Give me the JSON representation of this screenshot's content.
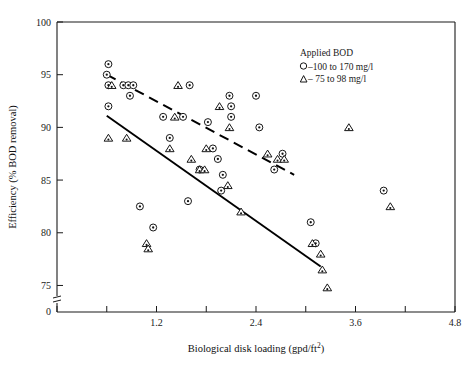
{
  "chart_data": {
    "type": "scatter",
    "title": "",
    "xlabel": "Biological disk loading (gpd/ft²)",
    "ylabel": "Efficiency (% BOD removal)",
    "xlim": [
      0,
      4.8
    ],
    "ylim": [
      74,
      100
    ],
    "xticks": [
      0,
      0.6,
      1.2,
      1.8,
      2.4,
      3.0,
      3.6,
      4.2,
      4.8
    ],
    "xticklabels": [
      "",
      "",
      "1.2",
      "",
      "2.4",
      "",
      "3.6",
      "",
      "4.8"
    ],
    "yticks": [
      75,
      80,
      85,
      90,
      95,
      100
    ],
    "yticklabels": [
      "75",
      "80",
      "85",
      "90",
      "95",
      "100"
    ],
    "y_axis_break": true,
    "y_break_label": "0",
    "grid": false,
    "legend_position": "top-right",
    "legend_title": "Applied BOD",
    "series": [
      {
        "name": "–100 to 170 mg/l",
        "marker": "circle-dot",
        "legend_symbol": "○",
        "points": [
          [
            0.62,
            96.0
          ],
          [
            0.6,
            95.0
          ],
          [
            0.62,
            94.0
          ],
          [
            0.8,
            94.0
          ],
          [
            0.86,
            94.0
          ],
          [
            0.92,
            94.0
          ],
          [
            0.88,
            93.0
          ],
          [
            1.6,
            94.0
          ],
          [
            0.62,
            92.0
          ],
          [
            1.28,
            91.0
          ],
          [
            1.52,
            91.0
          ],
          [
            2.08,
            93.0
          ],
          [
            2.1,
            92.0
          ],
          [
            2.4,
            93.0
          ],
          [
            1.36,
            89.0
          ],
          [
            2.1,
            91.0
          ],
          [
            2.44,
            90.0
          ],
          [
            1.82,
            90.5
          ],
          [
            1.88,
            88.0
          ],
          [
            1.94,
            87.0
          ],
          [
            1.72,
            86.0
          ],
          [
            2.0,
            85.5
          ],
          [
            1.98,
            84.0
          ],
          [
            2.72,
            87.5
          ],
          [
            2.62,
            86.0
          ],
          [
            1.58,
            83.0
          ],
          [
            3.06,
            81.0
          ],
          [
            3.12,
            79.0
          ],
          [
            3.94,
            84.0
          ],
          [
            1.0,
            82.5
          ],
          [
            1.16,
            80.5
          ]
        ]
      },
      {
        "name": "– 75 to 98 mg/l",
        "marker": "triangle-dot",
        "legend_symbol": "△",
        "points": [
          [
            0.66,
            94.0
          ],
          [
            1.46,
            94.0
          ],
          [
            0.62,
            89.0
          ],
          [
            0.84,
            89.0
          ],
          [
            1.96,
            92.0
          ],
          [
            1.42,
            91.0
          ],
          [
            2.08,
            90.0
          ],
          [
            1.36,
            88.0
          ],
          [
            1.8,
            88.0
          ],
          [
            1.62,
            87.0
          ],
          [
            2.54,
            87.5
          ],
          [
            2.66,
            87.0
          ],
          [
            2.74,
            87.0
          ],
          [
            1.72,
            86.0
          ],
          [
            1.78,
            86.0
          ],
          [
            2.06,
            84.5
          ],
          [
            1.08,
            79.0
          ],
          [
            1.1,
            78.5
          ],
          [
            2.22,
            82.0
          ],
          [
            3.08,
            79.0
          ],
          [
            3.18,
            78.0
          ],
          [
            3.2,
            76.5
          ],
          [
            3.26,
            74.8
          ],
          [
            4.02,
            82.5
          ],
          [
            3.52,
            90.0
          ]
        ]
      }
    ],
    "fit_lines": [
      {
        "name": "solid-fit-line",
        "style": "solid",
        "x0": 0.6,
        "y0": 91.1,
        "x1": 3.18,
        "y1": 76.8
      },
      {
        "name": "dashed-fit-line",
        "style": "dashed",
        "x0": 0.6,
        "y0": 95.0,
        "x1": 2.86,
        "y1": 85.5
      }
    ]
  },
  "legend": {
    "title": "Applied BOD",
    "entries": [
      {
        "symbol": "○",
        "label": "–100 to 170 mg/l"
      },
      {
        "symbol": "△",
        "label": "– 75 to 98 mg/l"
      }
    ]
  },
  "axes": {
    "x_title": "Biological disk loading (gpd/ft",
    "x_title_sup": "2",
    "x_title_tail": ")",
    "y_title": "Efficiency (% BOD removal)"
  }
}
